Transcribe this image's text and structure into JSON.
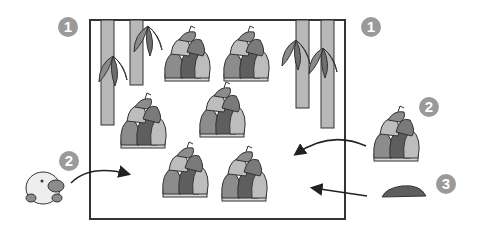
{
  "badges": [
    {
      "label": "1",
      "x": 58,
      "y": 17
    },
    {
      "label": "1",
      "x": 361,
      "y": 17
    },
    {
      "label": "2",
      "x": 59,
      "y": 151
    },
    {
      "label": "2",
      "x": 419,
      "y": 97
    },
    {
      "label": "3",
      "x": 436,
      "y": 174
    }
  ],
  "colors": {
    "frame": "#333333",
    "badge": "#9a9a9a",
    "bamboo_stalk": "#b8b8b8",
    "leaf": "#8a8a8a",
    "shoot_dark": "#5e5e5e",
    "shoot_mid": "#8c8c8c",
    "shoot_light": "#bdbdbd",
    "arrow": "#222222"
  },
  "scene": {
    "bamboo_stalks": 4,
    "bamboo_shoots_inside": 6,
    "outside_items": [
      "platypus-character",
      "bamboo-shoot",
      "dark-mound"
    ]
  }
}
